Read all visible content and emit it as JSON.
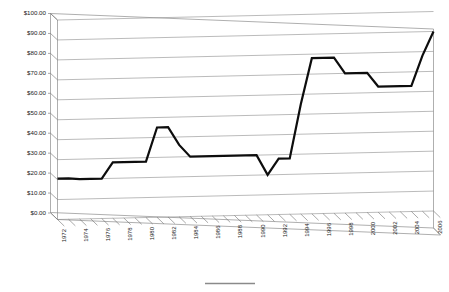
{
  "chart_data": {
    "type": "line",
    "title": "",
    "subtitle": "",
    "xlabel": "",
    "ylabel": "",
    "grid": true,
    "legend_position": "bottom",
    "style": "3d-line-chart",
    "ylim": [
      0,
      100
    ],
    "ytick_step": 10,
    "ytick_labels": [
      "$0.00",
      "$10.00",
      "$20.00",
      "$30.00",
      "$40.00",
      "$50.00",
      "$60.00",
      "$70.00",
      "$80.00",
      "$90.00",
      "$100.00"
    ],
    "ytick_values": [
      0,
      10,
      20,
      30,
      40,
      50,
      60,
      70,
      80,
      90,
      100
    ],
    "xlim": [
      1972,
      2006
    ],
    "xtick_label_step": 2,
    "xtick_labels": [
      "1972",
      "1974",
      "1976",
      "1978",
      "1980",
      "1982",
      "1984",
      "1986",
      "1988",
      "1990",
      "1992",
      "1994",
      "1996",
      "1998",
      "2000",
      "2002",
      "2004",
      "2006"
    ],
    "x": [
      1972,
      1973,
      1974,
      1975,
      1976,
      1977,
      1978,
      1979,
      1980,
      1981,
      1982,
      1983,
      1984,
      1985,
      1986,
      1987,
      1988,
      1989,
      1990,
      1991,
      1992,
      1993,
      1994,
      1995,
      1996,
      1997,
      1998,
      1999,
      2000,
      2001,
      2002,
      2003,
      2004,
      2005,
      2006
    ],
    "series": [
      {
        "name": "Value",
        "values": [
          20.5,
          20.5,
          20.0,
          20.0,
          20.0,
          28.0,
          28.0,
          28.0,
          28.0,
          45.0,
          45.0,
          36.0,
          30.0,
          30.0,
          30.0,
          30.0,
          30.0,
          30.0,
          30.0,
          20.0,
          28.0,
          28.0,
          55.0,
          78.0,
          78.0,
          78.0,
          70.0,
          70.0,
          70.0,
          63.0,
          63.0,
          63.0,
          63.0,
          78.0,
          90.0
        ]
      }
    ],
    "annotations": []
  },
  "legend": {
    "entries": [
      {
        "label": "",
        "color": "#8a8a8a",
        "marker": "line"
      }
    ]
  },
  "axis": {
    "currency_prefix": "$",
    "value_format": "0.00"
  }
}
